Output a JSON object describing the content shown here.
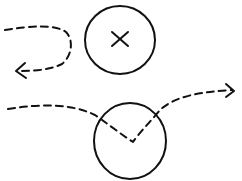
{
  "diagram": {
    "colors": {
      "stroke": "#111111",
      "background": "#ffffff"
    },
    "nodes": [
      {
        "id": "blocked-circle",
        "mark": "x",
        "cx": 120,
        "cy": 40,
        "r": 35
      },
      {
        "id": "pass-circle",
        "mark": "none",
        "cx": 130,
        "cy": 137,
        "r": 36
      }
    ],
    "paths": [
      {
        "id": "rejected-path",
        "style": "dashed",
        "arrow": "left",
        "description": "path approaches X circle and loops back"
      },
      {
        "id": "deflected-path",
        "style": "dashed",
        "arrow": "right",
        "description": "path enters circle and bounces out forward"
      }
    ]
  }
}
